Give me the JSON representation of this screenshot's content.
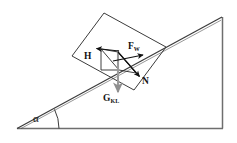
{
  "figure": {
    "type": "free-body-diagram",
    "canvas": {
      "width": 237,
      "height": 143
    },
    "background_color": "#ffffff",
    "line_color": "#3b3b3b",
    "vector_color": "#111111",
    "weight_vector_color": "#9a9a9a"
  },
  "labels": {
    "friction": {
      "symbol": "H",
      "subscript": ""
    },
    "applied": {
      "symbol": "F",
      "subscript": "W"
    },
    "normal": {
      "symbol": "N",
      "subscript": ""
    },
    "weight": {
      "symbol": "G",
      "subscript": "KL"
    },
    "angle": {
      "symbol": "α"
    }
  },
  "geometry": {
    "incline": {
      "apex": {
        "x": 222,
        "y": 17
      },
      "bottom_left": {
        "x": 17,
        "y": 128
      },
      "bottom_right": {
        "x": 223,
        "y": 128
      }
    },
    "block": {
      "corners": [
        {
          "x": 72,
          "y": 56
        },
        {
          "x": 104,
          "y": 13
        },
        {
          "x": 166,
          "y": 47
        },
        {
          "x": 134,
          "y": 90
        }
      ]
    },
    "vectors": {
      "H": {
        "from": {
          "x": 118,
          "y": 52
        },
        "to": {
          "x": 97,
          "y": 49
        }
      },
      "F_W": {
        "from": {
          "x": 118,
          "y": 52
        },
        "to": {
          "x": 141,
          "y": 58
        }
      },
      "N": {
        "from": {
          "x": 118,
          "y": 52
        },
        "to": {
          "x": 138,
          "y": 75
        }
      },
      "G_KL": {
        "from": {
          "x": 118,
          "y": 52
        },
        "to": {
          "x": 118,
          "y": 93
        }
      }
    },
    "angle_arc": {
      "vertex": {
        "x": 17,
        "y": 128
      },
      "radius": 42
    }
  }
}
